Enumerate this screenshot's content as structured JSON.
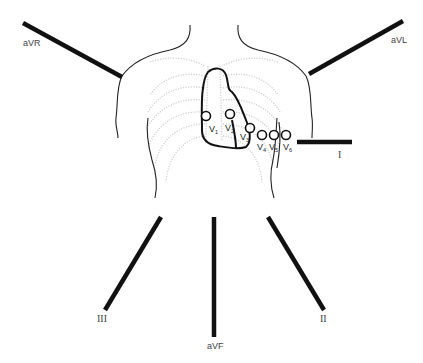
{
  "diagram": {
    "limb_leads": [
      {
        "id": "aVR",
        "label": "aVR"
      },
      {
        "id": "aVL",
        "label": "aVL"
      },
      {
        "id": "I",
        "label": "I"
      },
      {
        "id": "II",
        "label": "II"
      },
      {
        "id": "III",
        "label": "III"
      },
      {
        "id": "aVF",
        "label": "aVF"
      }
    ],
    "precordial_leads": [
      {
        "id": "V1",
        "letter": "V",
        "sub": "1"
      },
      {
        "id": "V2",
        "letter": "V",
        "sub": "2"
      },
      {
        "id": "V3",
        "letter": "V",
        "sub": "3"
      },
      {
        "id": "V4",
        "letter": "V",
        "sub": "4"
      },
      {
        "id": "V5",
        "letter": "V",
        "sub": "5"
      },
      {
        "id": "V6",
        "letter": "V",
        "sub": "6"
      }
    ],
    "colors": {
      "lead_line": "#111111",
      "outline": "#222222",
      "ribcage": "#cfcfcf",
      "label": "#444444"
    }
  }
}
